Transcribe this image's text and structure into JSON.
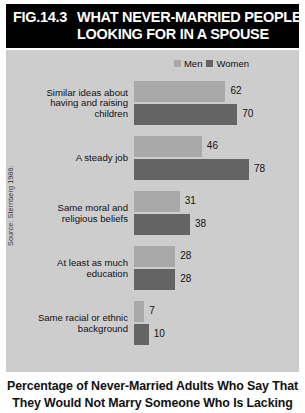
{
  "header": {
    "figure_number": "FIG.14.3",
    "title_line1": "WHAT NEVER-MARRIED PEOPLE ARE",
    "title_line2": "LOOKING FOR IN A SPOUSE"
  },
  "legend": {
    "men_label": "Men",
    "women_label": "Women",
    "men_color": "#a9a9a9",
    "women_color": "#646464"
  },
  "source_note": "Source: Sternberg 1986.",
  "caption": {
    "line1": "Percentage of Never-Married Adults Who Say That",
    "line2": "They Would Not Marry Someone Who Is Lacking"
  },
  "chart_data": {
    "type": "bar",
    "orientation": "horizontal",
    "title": "WHAT NEVER-MARRIED PEOPLE ARE LOOKING FOR IN A SPOUSE",
    "xlabel": "",
    "ylabel": "",
    "xlim": [
      0,
      80
    ],
    "grid": false,
    "legend_position": "top-right",
    "categories": [
      "Similar ideas about having and raising children",
      "A steady job",
      "Same moral and religious beliefs",
      "At least as much education",
      "Same racial or ethnic background"
    ],
    "category_lines": [
      [
        "Similar ideas about",
        "having and raising",
        "children"
      ],
      [
        "A steady job"
      ],
      [
        "Same moral and",
        "religious beliefs"
      ],
      [
        "At least as much",
        "education"
      ],
      [
        "Same racial or ethnic",
        "background"
      ]
    ],
    "series": [
      {
        "name": "Men",
        "color": "#a9a9a9",
        "values": [
          62,
          46,
          31,
          28,
          7
        ]
      },
      {
        "name": "Women",
        "color": "#646464",
        "values": [
          70,
          78,
          38,
          28,
          10
        ]
      }
    ]
  }
}
